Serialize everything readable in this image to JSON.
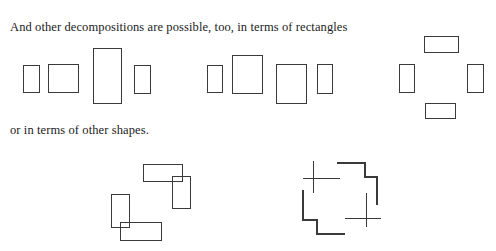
{
  "page": {
    "width": 496,
    "height": 251,
    "background": "#ffffff",
    "stroke_color": "#3a3a3a",
    "text_color": "#1b1b1b"
  },
  "captions": {
    "rectangles": "And other decompositions are possible, too, in terms of rectangles",
    "shapes": "or in terms of other shapes."
  },
  "figures": {
    "row1": {
      "group_a": {
        "label": "row-of-four-rectangles-left",
        "rects": [
          {
            "name": "rect-a1",
            "x": 23,
            "y": 65,
            "w": 16,
            "h": 27
          },
          {
            "name": "rect-a2",
            "x": 48,
            "y": 64,
            "w": 30,
            "h": 28
          },
          {
            "name": "rect-a3",
            "x": 93,
            "y": 48,
            "w": 28,
            "h": 55
          },
          {
            "name": "rect-a4",
            "x": 134,
            "y": 65,
            "w": 16,
            "h": 28
          }
        ]
      },
      "group_b": {
        "label": "row-of-four-rectangles-middle",
        "rects": [
          {
            "name": "rect-b1",
            "x": 207,
            "y": 65,
            "w": 15,
            "h": 27
          },
          {
            "name": "rect-b2",
            "x": 232,
            "y": 55,
            "w": 30,
            "h": 38
          },
          {
            "name": "rect-b3",
            "x": 276,
            "y": 64,
            "w": 30,
            "h": 39
          },
          {
            "name": "rect-b4",
            "x": 317,
            "y": 64,
            "w": 15,
            "h": 29
          }
        ]
      },
      "group_c": {
        "label": "cross-arrangement-of-four-rectangles-right",
        "rects": [
          {
            "name": "rect-c-top",
            "x": 424,
            "y": 36,
            "w": 34,
            "h": 16
          },
          {
            "name": "rect-c-left",
            "x": 399,
            "y": 64,
            "w": 15,
            "h": 28
          },
          {
            "name": "rect-c-right",
            "x": 467,
            "y": 64,
            "w": 16,
            "h": 28
          },
          {
            "name": "rect-c-bottom",
            "x": 425,
            "y": 103,
            "w": 30,
            "h": 15
          }
        ]
      }
    },
    "row2": {
      "group_d": {
        "label": "two-overlapping-l-shapes-left",
        "rects": [
          {
            "name": "rect-d1-horizontal",
            "x": 143,
            "y": 164,
            "w": 39,
            "h": 17
          },
          {
            "name": "rect-d2-vertical",
            "x": 172,
            "y": 176,
            "w": 18,
            "h": 32
          },
          {
            "name": "rect-d3-vertical",
            "x": 111,
            "y": 194,
            "w": 18,
            "h": 33
          },
          {
            "name": "rect-d4-horizontal",
            "x": 120,
            "y": 222,
            "w": 41,
            "h": 18
          }
        ]
      },
      "group_e": {
        "label": "pinwheel-with-two-crosses-right",
        "crosses": [
          {
            "name": "cross-upper-left",
            "vertical": {
              "x": 313,
              "y1": 161,
              "y2": 193
            },
            "horizontal": {
              "y": 178,
              "x1": 303,
              "x2": 340
            }
          },
          {
            "name": "cross-lower-right",
            "vertical": {
              "x": 366,
              "y1": 193,
              "y2": 227
            },
            "horizontal": {
              "y": 218,
              "x1": 345,
              "x2": 381
            }
          }
        ],
        "steps": [
          {
            "name": "step-upper-right",
            "points": "337,163 365,163 365,177 377,177 377,205"
          },
          {
            "name": "step-lower-left",
            "points": "303,190 303,220 317,220 317,234 345,234"
          }
        ]
      }
    }
  }
}
